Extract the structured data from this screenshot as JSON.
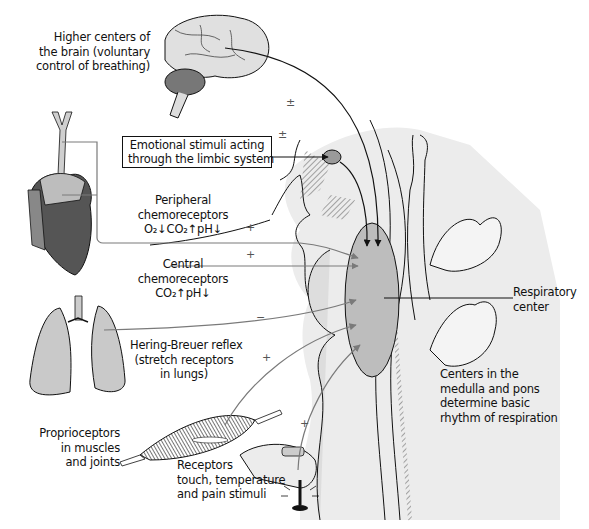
{
  "diagram": {
    "colors": {
      "background": "#ffffff",
      "tissue_light": "#e6e6e6",
      "respiratory_center": "#b8b8b8",
      "arrow_gray": "#8a8a8a",
      "arrow_black": "#111111",
      "heart_dark": "#555555",
      "muscle_dark": "#3a3a3a"
    },
    "labels": {
      "higher_centers": [
        "Higher centers of",
        "the brain (voluntary",
        "control of breathing)"
      ],
      "emotional": [
        "Emotional stimuli acting",
        "through the limbic system"
      ],
      "peripheral": [
        "Peripheral",
        "chemoreceptors",
        "O₂↓CO₂↑pH↓"
      ],
      "central": [
        "Central",
        "chemoreceptors",
        "CO₂↑pH↓"
      ],
      "hering_breuer": [
        "Hering-Breuer reflex",
        "(stretch receptors",
        "in lungs)"
      ],
      "proprioceptors": [
        "Proprioceptors",
        "in muscles",
        "and joints"
      ],
      "receptors": [
        "Receptors",
        "touch, temperature",
        "and pain stimuli"
      ],
      "respiratory_center": [
        "Respiratory",
        "center"
      ],
      "medulla_pons": [
        "Centers in the",
        "medulla and pons",
        "determine basic",
        "rhythm of respiration"
      ]
    },
    "signs": {
      "higher_centers": "±",
      "emotional": "±",
      "peripheral": "+",
      "central": "+",
      "hering_breuer": "−",
      "proprioceptors": "+",
      "receptors": "+"
    },
    "inputs": [
      {
        "source": "Higher centers of the brain",
        "effect": "±"
      },
      {
        "source": "Limbic system",
        "effect": "±"
      },
      {
        "source": "Peripheral chemoreceptors",
        "effect": "+"
      },
      {
        "source": "Central chemoreceptors",
        "effect": "+"
      },
      {
        "source": "Hering-Breuer reflex",
        "effect": "−"
      },
      {
        "source": "Proprioceptors",
        "effect": "+"
      },
      {
        "source": "Touch, temperature and pain receptors",
        "effect": "+"
      }
    ]
  }
}
